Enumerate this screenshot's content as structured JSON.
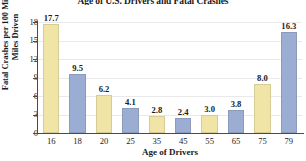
{
  "chart_data": {
    "type": "bar",
    "title": "Age of U.S. Drivers and Fatal Crashes",
    "xlabel": "Age of Drivers",
    "ylabel": "Fatal Crashes per 100 Million Miles Driven",
    "categories": [
      "16",
      "18",
      "20",
      "25",
      "35",
      "45",
      "55",
      "65",
      "75",
      "79"
    ],
    "values": [
      17.7,
      9.5,
      6.2,
      4.1,
      2.8,
      2.4,
      3.0,
      3.8,
      8.0,
      16.3
    ],
    "value_labels": [
      "17.7",
      "9.5",
      "6.2",
      "4.1",
      "2.8",
      "2.4",
      "3.0",
      "3.8",
      "8.0",
      "16.3"
    ],
    "bar_colors": [
      "#f0e4a6",
      "#9badd2",
      "#f0e4a6",
      "#9badd2",
      "#f0e4a6",
      "#9badd2",
      "#f0e4a6",
      "#9badd2",
      "#f0e4a6",
      "#9badd2"
    ],
    "ylim": [
      0,
      18
    ],
    "yticks": [
      0,
      3,
      6,
      9,
      12,
      15,
      18
    ],
    "ytick_labels": [
      "0",
      "3",
      "6",
      "9",
      "12",
      "15",
      "18"
    ],
    "grid": true,
    "grid_axis": "y",
    "legend": null,
    "palette": {
      "yellow": "#f0e4a6",
      "blue": "#9badd2",
      "gridline": "#e9e9ec",
      "axis": "#4a4a4a",
      "text": "#1b1b1b",
      "background": "#ffffff"
    }
  }
}
